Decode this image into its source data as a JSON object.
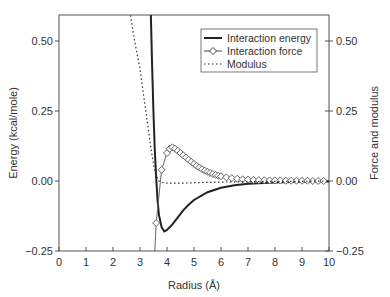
{
  "chart_data": {
    "type": "line",
    "title": "",
    "xlabel": "Radius (Å)",
    "ylabel": "Energy (kcal/mole)",
    "ylabel_right": "Force and modulus",
    "xlim": [
      0,
      10
    ],
    "ylim": [
      -0.25,
      0.6
    ],
    "ylim_right": [
      -0.25,
      0.6
    ],
    "x_ticks": [
      "0",
      "1",
      "2",
      "3",
      "4",
      "5",
      "6",
      "7",
      "8",
      "9",
      "10"
    ],
    "y_ticks": [
      "−0.25",
      "0.00",
      "0.25",
      "0.50"
    ],
    "y_ticks_right": [
      "−0.25",
      "0.00",
      "0.25",
      "0.50"
    ],
    "grid": false,
    "legend_position": "upper right",
    "legend": [
      "Interaction energy",
      "Interaction force",
      "Modulus"
    ],
    "series": [
      {
        "name": "Interaction energy",
        "style": "solid-thick",
        "x": [
          3.4,
          3.45,
          3.5,
          3.55,
          3.6,
          3.65,
          3.7,
          3.8,
          3.9,
          4.0,
          4.2,
          4.4,
          4.6,
          4.8,
          5.0,
          5.5,
          6.0,
          6.5,
          7.0,
          8.0,
          9.0,
          10.0
        ],
        "values": [
          0.6,
          0.4,
          0.24,
          0.11,
          0.01,
          -0.07,
          -0.12,
          -0.165,
          -0.18,
          -0.175,
          -0.155,
          -0.13,
          -0.105,
          -0.085,
          -0.068,
          -0.04,
          -0.024,
          -0.015,
          -0.01,
          -0.005,
          -0.003,
          -0.002
        ]
      },
      {
        "name": "Interaction force",
        "style": "line-diamonds",
        "x": [
          3.55,
          3.6,
          3.8,
          4.0,
          4.1,
          4.2,
          4.3,
          4.4,
          4.5,
          4.6,
          4.7,
          4.8,
          4.9,
          5.0,
          5.1,
          5.2,
          5.3,
          5.4,
          5.5,
          5.6,
          5.7,
          5.8,
          5.9,
          6.0,
          6.2,
          6.4,
          6.6,
          6.8,
          7.0,
          7.2,
          7.4,
          7.6,
          7.8,
          8.0,
          8.2,
          8.4,
          8.6,
          8.8,
          9.0,
          9.2,
          9.4,
          9.6,
          9.8
        ],
        "values": [
          -0.25,
          -0.15,
          0.04,
          0.1,
          0.115,
          0.12,
          0.115,
          0.108,
          0.1,
          0.092,
          0.084,
          0.076,
          0.068,
          0.061,
          0.054,
          0.048,
          0.042,
          0.037,
          0.033,
          0.029,
          0.025,
          0.022,
          0.019,
          0.017,
          0.013,
          0.01,
          0.008,
          0.006,
          0.005,
          0.004,
          0.003,
          0.003,
          0.002,
          0.002,
          0.002,
          0.001,
          0.001,
          0.001,
          0.001,
          0.001,
          0.0,
          0.0,
          0.0
        ]
      },
      {
        "name": "Modulus",
        "style": "dotted",
        "x": [
          2.6,
          2.8,
          3.0,
          3.1,
          3.2,
          3.3,
          3.4,
          3.5,
          3.6,
          3.7,
          3.8,
          4.0,
          4.5,
          5.0,
          6.0,
          7.0,
          8.0,
          9.0,
          10.0
        ],
        "values": [
          0.62,
          0.5,
          0.4,
          0.33,
          0.26,
          0.19,
          0.12,
          0.06,
          0.02,
          0.0,
          -0.005,
          -0.008,
          -0.008,
          -0.006,
          -0.004,
          -0.002,
          -0.001,
          -0.001,
          0.0
        ]
      }
    ]
  }
}
